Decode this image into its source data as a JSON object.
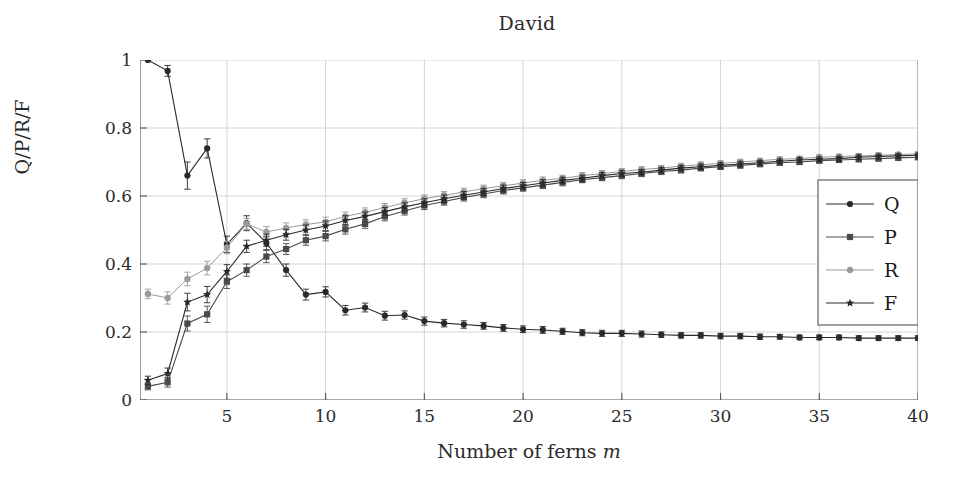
{
  "chart_data": {
    "type": "line",
    "title": "David",
    "xlabel": "Number of ferns m",
    "xlabel_plain": "Number of ferns",
    "xlabel_italic": "m",
    "ylabel": "Q/P/R/F",
    "xlim": [
      0.6,
      40
    ],
    "ylim": [
      0,
      1
    ],
    "xticks": [
      5,
      10,
      15,
      20,
      25,
      30,
      35,
      40
    ],
    "yticks": [
      0,
      0.2,
      0.4,
      0.6,
      0.8,
      1
    ],
    "ytick_labels": [
      "0",
      "0.2",
      "0.4",
      "0.6",
      "0.8",
      "1"
    ],
    "grid": true,
    "legend_position": "right-middle",
    "errorbars": true,
    "x": [
      1,
      2,
      3,
      4,
      5,
      6,
      7,
      8,
      9,
      10,
      11,
      12,
      13,
      14,
      15,
      16,
      17,
      18,
      19,
      20,
      21,
      22,
      23,
      24,
      25,
      26,
      27,
      28,
      29,
      30,
      31,
      32,
      33,
      34,
      35,
      36,
      37,
      38,
      39,
      40
    ],
    "series": [
      {
        "name": "Q",
        "marker": "circle",
        "color": "#2a2a2a",
        "values": [
          1.0,
          0.968,
          0.66,
          0.74,
          0.458,
          0.52,
          0.462,
          0.382,
          0.31,
          0.318,
          0.264,
          0.272,
          0.248,
          0.25,
          0.232,
          0.226,
          0.222,
          0.218,
          0.212,
          0.208,
          0.206,
          0.202,
          0.198,
          0.196,
          0.196,
          0.194,
          0.192,
          0.19,
          0.19,
          0.188,
          0.188,
          0.186,
          0.186,
          0.184,
          0.184,
          0.184,
          0.182,
          0.182,
          0.182,
          0.182
        ],
        "err": [
          0.0,
          0.016,
          0.04,
          0.028,
          0.024,
          0.022,
          0.02,
          0.018,
          0.016,
          0.015,
          0.014,
          0.013,
          0.013,
          0.012,
          0.012,
          0.011,
          0.011,
          0.01,
          0.01,
          0.01,
          0.01,
          0.009,
          0.009,
          0.009,
          0.009,
          0.009,
          0.008,
          0.008,
          0.008,
          0.008,
          0.008,
          0.008,
          0.007,
          0.007,
          0.007,
          0.007,
          0.007,
          0.007,
          0.007,
          0.007
        ]
      },
      {
        "name": "P",
        "marker": "square",
        "color": "#4a4a4a",
        "values": [
          0.04,
          0.052,
          0.225,
          0.252,
          0.348,
          0.382,
          0.422,
          0.444,
          0.47,
          0.482,
          0.502,
          0.518,
          0.54,
          0.556,
          0.572,
          0.584,
          0.596,
          0.606,
          0.616,
          0.624,
          0.632,
          0.64,
          0.648,
          0.654,
          0.66,
          0.666,
          0.672,
          0.676,
          0.682,
          0.686,
          0.69,
          0.694,
          0.698,
          0.7,
          0.704,
          0.706,
          0.708,
          0.71,
          0.712,
          0.714
        ],
        "err": [
          0.01,
          0.014,
          0.022,
          0.024,
          0.02,
          0.018,
          0.018,
          0.016,
          0.015,
          0.014,
          0.014,
          0.013,
          0.013,
          0.012,
          0.012,
          0.011,
          0.011,
          0.011,
          0.01,
          0.01,
          0.01,
          0.01,
          0.009,
          0.009,
          0.009,
          0.009,
          0.009,
          0.008,
          0.008,
          0.008,
          0.008,
          0.008,
          0.008,
          0.007,
          0.007,
          0.007,
          0.007,
          0.007,
          0.007,
          0.007
        ]
      },
      {
        "name": "R",
        "marker": "circle-light",
        "color": "#9a9a9a",
        "values": [
          0.312,
          0.3,
          0.356,
          0.388,
          0.448,
          0.518,
          0.494,
          0.506,
          0.516,
          0.524,
          0.54,
          0.552,
          0.566,
          0.58,
          0.592,
          0.602,
          0.612,
          0.622,
          0.63,
          0.638,
          0.646,
          0.652,
          0.66,
          0.666,
          0.672,
          0.678,
          0.682,
          0.688,
          0.692,
          0.696,
          0.7,
          0.704,
          0.708,
          0.71,
          0.714,
          0.716,
          0.718,
          0.72,
          0.722,
          0.724
        ],
        "err": [
          0.014,
          0.018,
          0.02,
          0.02,
          0.018,
          0.016,
          0.016,
          0.015,
          0.014,
          0.014,
          0.013,
          0.013,
          0.012,
          0.012,
          0.011,
          0.011,
          0.011,
          0.01,
          0.01,
          0.01,
          0.01,
          0.009,
          0.009,
          0.009,
          0.009,
          0.008,
          0.008,
          0.008,
          0.008,
          0.008,
          0.008,
          0.007,
          0.007,
          0.007,
          0.007,
          0.007,
          0.007,
          0.007,
          0.006,
          0.006
        ]
      },
      {
        "name": "F",
        "marker": "star",
        "color": "#2a2a2a",
        "values": [
          0.058,
          0.078,
          0.288,
          0.31,
          0.378,
          0.452,
          0.47,
          0.486,
          0.5,
          0.512,
          0.528,
          0.54,
          0.554,
          0.568,
          0.58,
          0.592,
          0.602,
          0.612,
          0.622,
          0.63,
          0.638,
          0.646,
          0.652,
          0.66,
          0.666,
          0.67,
          0.676,
          0.682,
          0.686,
          0.69,
          0.694,
          0.698,
          0.702,
          0.706,
          0.708,
          0.71,
          0.714,
          0.716,
          0.718,
          0.72
        ],
        "err": [
          0.012,
          0.016,
          0.026,
          0.024,
          0.02,
          0.018,
          0.018,
          0.016,
          0.015,
          0.014,
          0.014,
          0.013,
          0.012,
          0.012,
          0.012,
          0.011,
          0.011,
          0.01,
          0.01,
          0.01,
          0.01,
          0.009,
          0.009,
          0.009,
          0.009,
          0.008,
          0.008,
          0.008,
          0.008,
          0.008,
          0.008,
          0.007,
          0.007,
          0.007,
          0.007,
          0.007,
          0.007,
          0.007,
          0.006,
          0.006
        ]
      }
    ],
    "legend": [
      "Q",
      "P",
      "R",
      "F"
    ]
  }
}
